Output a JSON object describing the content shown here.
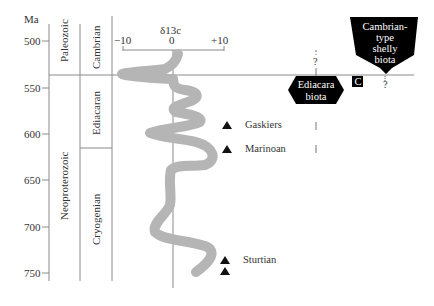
{
  "axis": {
    "unit_label": "Ma",
    "ticks": [
      "500",
      "550",
      "600",
      "650",
      "700",
      "750"
    ]
  },
  "eras": {
    "paleozoic": "Paleozoic",
    "neoproterozoic": "Neoproterozoic"
  },
  "periods": {
    "cambrian": "Cambrian",
    "ediacaran": "Ediacaran",
    "cryogenian": "Cryogenian"
  },
  "isotope": {
    "title": "δ13c",
    "ticks": [
      "−10",
      "0",
      "+10"
    ]
  },
  "glaciations": [
    {
      "label": "Gaskiers"
    },
    {
      "label": "Marinoan"
    },
    {
      "label": "Sturtian"
    }
  ],
  "biota": {
    "ediacara_line1": "Ediacara",
    "ediacara_line2": "biota",
    "cambrian_line1": "Cambrian-",
    "cambrian_line2": "type",
    "cambrian_line3": "shelly",
    "cambrian_line4": "biota",
    "c_marker": "C",
    "question": "?"
  },
  "colors": {
    "curve": "#b5b5b5",
    "lines": "#8a8a8a",
    "biota_fill": "#000000"
  }
}
